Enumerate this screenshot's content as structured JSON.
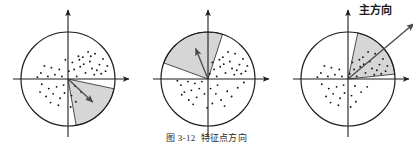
{
  "figure": {
    "caption_number": "图 3-12",
    "caption_text": "特征点方向",
    "principal_direction_label": "主方向"
  },
  "style": {
    "stroke_color": "#1c1c1c",
    "wedge_fill": "#d6d6d6",
    "wedge_stroke": "#3a3a3a",
    "arrow_color": "#4a4a4a",
    "dot_color": "#161616",
    "background": "#ffffff"
  },
  "chart_data": {
    "type": "scatter",
    "title": "特征点方向",
    "xlabel": "",
    "ylabel": "",
    "panels": [
      {
        "name": "panel-1",
        "center": [
          68,
          79
        ],
        "radius": 47,
        "axis_x_range": [
          13,
          129
        ],
        "axis_y_range": [
          10,
          137
        ],
        "wedge_start_deg": -12,
        "wedge_end_deg": -80,
        "arrow_deg": -43,
        "arrow_length": 34,
        "points": [
          [
            0.62,
            0.58
          ],
          [
            0.8,
            0.46
          ],
          [
            0.46,
            0.62
          ],
          [
            0.34,
            0.5
          ],
          [
            0.72,
            0.33
          ],
          [
            0.9,
            0.3
          ],
          [
            0.55,
            0.24
          ],
          [
            0.28,
            0.28
          ],
          [
            0.14,
            0.22
          ],
          [
            0.4,
            0.14
          ],
          [
            0.6,
            0.1
          ],
          [
            0.76,
            0.12
          ],
          [
            0.2,
            0.06
          ],
          [
            0.02,
            0.18
          ],
          [
            0.36,
            0.34
          ],
          [
            0.5,
            0.4
          ],
          [
            0.66,
            0.2
          ],
          [
            0.86,
            0.18
          ],
          [
            0.1,
            0.38
          ],
          [
            0.26,
            0.44
          ],
          [
            -0.3,
            0.1
          ],
          [
            -0.46,
            0.06
          ],
          [
            -0.62,
            0.14
          ],
          [
            -0.2,
            0.22
          ],
          [
            -0.38,
            0.26
          ],
          [
            -0.54,
            0.3
          ],
          [
            -0.7,
            0.04
          ],
          [
            -0.14,
            0.06
          ],
          [
            -0.26,
            -0.18
          ],
          [
            -0.44,
            -0.22
          ],
          [
            -0.6,
            -0.12
          ],
          [
            -0.34,
            -0.34
          ],
          [
            -0.5,
            -0.4
          ],
          [
            -0.18,
            -0.44
          ],
          [
            -0.64,
            -0.3
          ],
          [
            -0.4,
            -0.54
          ],
          [
            -0.22,
            -0.6
          ],
          [
            -0.08,
            -0.32
          ],
          [
            0.08,
            -0.38
          ],
          [
            0.18,
            -0.52
          ],
          [
            0.06,
            -0.64
          ],
          [
            0.3,
            -0.3
          ],
          [
            0.44,
            -0.46
          ],
          [
            -0.1,
            -0.14
          ],
          [
            0.16,
            -0.16
          ],
          [
            0.52,
            0.52
          ],
          [
            0.24,
            0.52
          ],
          [
            -0.06,
            0.44
          ]
        ]
      },
      {
        "name": "panel-2",
        "center": [
          208,
          79
        ],
        "radius": 47,
        "axis_x_range": [
          153,
          269
        ],
        "axis_y_range": [
          10,
          137
        ],
        "wedge_start_deg": 72,
        "wedge_end_deg": 160,
        "arrow_deg": 112,
        "arrow_length": 33,
        "points": [
          [
            0.62,
            0.58
          ],
          [
            0.8,
            0.46
          ],
          [
            0.46,
            0.62
          ],
          [
            0.34,
            0.5
          ],
          [
            0.72,
            0.33
          ],
          [
            0.9,
            0.3
          ],
          [
            0.55,
            0.24
          ],
          [
            0.28,
            0.28
          ],
          [
            0.14,
            0.22
          ],
          [
            0.4,
            0.14
          ],
          [
            0.6,
            0.1
          ],
          [
            0.76,
            0.12
          ],
          [
            0.2,
            0.06
          ],
          [
            0.36,
            0.34
          ],
          [
            0.5,
            0.4
          ],
          [
            0.66,
            0.2
          ],
          [
            0.86,
            0.18
          ],
          [
            0.1,
            0.38
          ],
          [
            0.26,
            0.44
          ],
          [
            0.04,
            0.12
          ],
          [
            -0.3,
            -0.1
          ],
          [
            -0.46,
            -0.06
          ],
          [
            -0.62,
            -0.14
          ],
          [
            -0.2,
            -0.22
          ],
          [
            -0.38,
            -0.26
          ],
          [
            -0.54,
            -0.3
          ],
          [
            -0.7,
            -0.04
          ],
          [
            -0.14,
            -0.06
          ],
          [
            -0.26,
            -0.42
          ],
          [
            -0.44,
            -0.48
          ],
          [
            -0.6,
            -0.36
          ],
          [
            -0.34,
            -0.58
          ],
          [
            0.06,
            -0.22
          ],
          [
            0.18,
            -0.34
          ],
          [
            0.3,
            -0.48
          ],
          [
            0.44,
            -0.28
          ],
          [
            0.1,
            -0.56
          ],
          [
            -0.08,
            -0.34
          ],
          [
            0.54,
            -0.4
          ],
          [
            0.22,
            -0.14
          ],
          [
            0.68,
            -0.2
          ],
          [
            0.38,
            -0.62
          ],
          [
            -0.02,
            -0.66
          ],
          [
            0.82,
            -0.08
          ]
        ]
      },
      {
        "name": "panel-3",
        "center": [
          348,
          79
        ],
        "radius": 47,
        "axis_x_range": [
          293,
          409
        ],
        "axis_y_range": [
          10,
          137
        ],
        "wedge_start_deg": 6,
        "wedge_end_deg": 78,
        "arrow_deg": 40,
        "arrow_length": 86,
        "points": [
          [
            0.62,
            0.58
          ],
          [
            0.8,
            0.46
          ],
          [
            0.46,
            0.62
          ],
          [
            0.34,
            0.5
          ],
          [
            0.72,
            0.33
          ],
          [
            0.9,
            0.3
          ],
          [
            0.55,
            0.24
          ],
          [
            0.28,
            0.28
          ],
          [
            0.14,
            0.22
          ],
          [
            0.4,
            0.14
          ],
          [
            0.6,
            0.1
          ],
          [
            0.76,
            0.12
          ],
          [
            0.2,
            0.06
          ],
          [
            0.36,
            0.34
          ],
          [
            0.5,
            0.4
          ],
          [
            0.66,
            0.2
          ],
          [
            0.86,
            0.18
          ],
          [
            0.1,
            0.38
          ],
          [
            0.26,
            0.44
          ],
          [
            0.04,
            0.12
          ],
          [
            -0.3,
            0.1
          ],
          [
            -0.46,
            0.06
          ],
          [
            -0.62,
            0.14
          ],
          [
            -0.2,
            0.22
          ],
          [
            -0.38,
            0.26
          ],
          [
            -0.54,
            0.3
          ],
          [
            -0.7,
            0.04
          ],
          [
            -0.14,
            0.06
          ],
          [
            -0.26,
            -0.18
          ],
          [
            -0.44,
            -0.22
          ],
          [
            -0.6,
            -0.12
          ],
          [
            -0.34,
            -0.34
          ],
          [
            -0.5,
            -0.4
          ],
          [
            -0.18,
            -0.44
          ],
          [
            -0.4,
            -0.54
          ],
          [
            -0.22,
            -0.6
          ],
          [
            -0.08,
            -0.32
          ],
          [
            0.08,
            -0.38
          ],
          [
            0.18,
            -0.52
          ],
          [
            0.06,
            -0.64
          ],
          [
            0.3,
            -0.3
          ],
          [
            0.16,
            -0.16
          ],
          [
            -0.1,
            -0.14
          ],
          [
            0.44,
            -0.18
          ]
        ]
      }
    ]
  }
}
